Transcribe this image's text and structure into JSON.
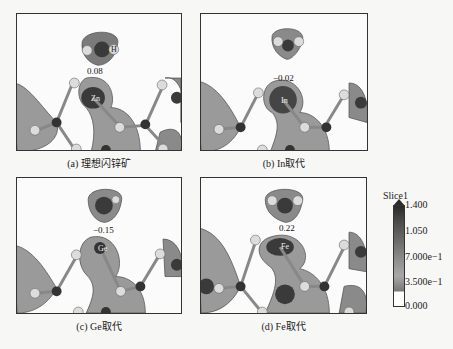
{
  "figure": {
    "panels": [
      {
        "id": "a",
        "caption": "(a) 理想闪锌矿",
        "charge": "0.08",
        "top_atom": "H",
        "center_atom": "Zn"
      },
      {
        "id": "b",
        "caption": "(b) In取代",
        "charge": "−0.02",
        "top_atom": "",
        "center_atom": "In"
      },
      {
        "id": "c",
        "caption": "(c) Ge取代",
        "charge": "−0.15",
        "top_atom": "",
        "center_atom": "Ge"
      },
      {
        "id": "d",
        "caption": "(d) Fe取代",
        "charge": "0.22",
        "top_atom": "",
        "center_atom": "Fe"
      }
    ],
    "legend": {
      "title": "Slice1",
      "ticks": [
        "1.400",
        "1.050",
        "7.000e−1",
        "3.500e−1",
        "0.000"
      ],
      "colors": {
        "max": "#2a2a2a",
        "mid": "#909090",
        "min": "#ffffff"
      }
    }
  },
  "bleed_text": {
    "line1": "",
    "line2": ""
  }
}
